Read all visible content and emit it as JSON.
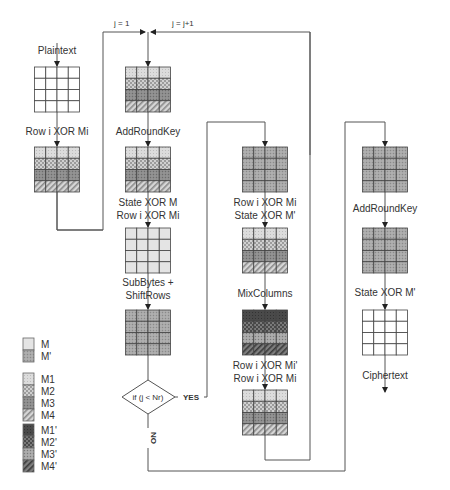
{
  "diagram": {
    "loop_labels": {
      "init": "j = 1",
      "increment": "j = j+1"
    },
    "columns": [
      {
        "id": "col1",
        "blocks": [
          {
            "label": "Plaintext",
            "grid": "plain"
          },
          {
            "label": "Row i XOR Mi",
            "grid": "M1234"
          }
        ]
      },
      {
        "id": "col2",
        "blocks": [
          {
            "label": "",
            "grid": "M1234"
          },
          {
            "label": "AddRoundKey",
            "grid": "M1234"
          },
          {
            "label": "State XOR M",
            "label2": "Row i XOR Mi",
            "grid": "M"
          },
          {
            "label": "SubBytes +",
            "label2": "ShiftRows",
            "grid": "Mprime"
          }
        ]
      },
      {
        "id": "col3",
        "blocks": [
          {
            "label": "",
            "grid": "Mprime"
          },
          {
            "label": "Row i XOR Mi",
            "label2": "State XOR M'",
            "grid": "M1234"
          },
          {
            "label": "MixColumns",
            "grid": "M1234prime"
          },
          {
            "label": "Row i XOR Mi'",
            "label2": "Row i XOR Mi",
            "grid": "M1234"
          }
        ]
      },
      {
        "id": "col4",
        "blocks": [
          {
            "label": "",
            "grid": "Mprime"
          },
          {
            "label": "AddRoundKey",
            "grid": "Mprime"
          },
          {
            "label": "State XOR M'",
            "grid": "plain"
          },
          {
            "label": "Ciphertext",
            "grid": null
          }
        ]
      }
    ],
    "decision": {
      "condition": "if (j < Nr)",
      "yes": "YES",
      "no": "NO"
    }
  },
  "legend": {
    "groups": [
      [
        {
          "key": "M",
          "label": "M"
        },
        {
          "key": "Mp",
          "label": "M'"
        }
      ],
      [
        {
          "key": "M1",
          "label": "M1"
        },
        {
          "key": "M2",
          "label": "M2"
        },
        {
          "key": "M3",
          "label": "M3"
        },
        {
          "key": "M4",
          "label": "M4"
        }
      ],
      [
        {
          "key": "M1p",
          "label": "M1'"
        },
        {
          "key": "M2p",
          "label": "M2'"
        },
        {
          "key": "M3p",
          "label": "M3'"
        },
        {
          "key": "M4p",
          "label": "M4'"
        }
      ]
    ]
  }
}
